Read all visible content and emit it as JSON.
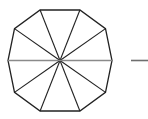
{
  "canvas": {
    "width": 148,
    "height": 119,
    "background": "#ffffff"
  },
  "figure": {
    "shape_name": "decagon",
    "sides": 10,
    "triangle_count": 10,
    "center": {
      "x": 60,
      "y": 60.5
    },
    "radius": 52,
    "rotation_deg": 18,
    "outline_color": "#222222",
    "outline_width": 1.3,
    "spoke_color": "#222222",
    "spoke_width": 1.1,
    "diameter_color": "#8a8a8a",
    "diameter_width": 1.6,
    "vertices": [
      {
        "x": 40.1,
        "y": 10.0
      },
      {
        "x": 79.9,
        "y": 10.0
      },
      {
        "x": 105.5,
        "y": 28.6
      },
      {
        "x": 112.0,
        "y": 60.5
      },
      {
        "x": 105.5,
        "y": 92.4
      },
      {
        "x": 79.9,
        "y": 111.0
      },
      {
        "x": 40.1,
        "y": 111.0
      },
      {
        "x": 14.5,
        "y": 92.4
      },
      {
        "x": 8.0,
        "y": 60.5
      },
      {
        "x": 14.5,
        "y": 28.6
      }
    ],
    "horizontal_diameter": {
      "x1": 8.0,
      "y1": 60.5,
      "x2": 112.0,
      "y2": 60.5
    }
  },
  "side_mark": {
    "name": "horizontal-dash",
    "color": "#6e6e6e",
    "width": 1.6,
    "x1": 131.0,
    "y1": 60.5,
    "x2": 148.0,
    "y2": 60.5
  },
  "chart_data": {
    "type": "diagram",
    "polygon_sides": 10,
    "segments": 10,
    "center_point": [
      60,
      60.5
    ],
    "circumradius": 52,
    "vertex_angles_deg": [
      252,
      288,
      324,
      0,
      36,
      72,
      108,
      144,
      180,
      216
    ],
    "annotations": [
      "horizontal gray diameter through center",
      "short horizontal dash to the right of the figure"
    ]
  }
}
